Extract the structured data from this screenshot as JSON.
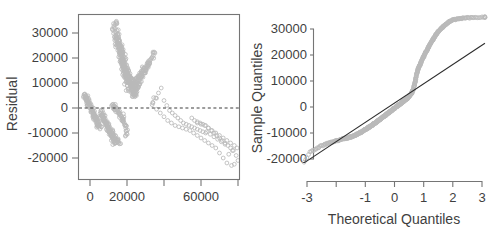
{
  "figure": {
    "panels": 2,
    "background": "#ffffff",
    "point_color": "#b9b9b9",
    "line_color": "#2b2b2b",
    "axis_color": "#757575",
    "text_color": "#3f3f3f"
  },
  "chart_data": [
    {
      "type": "scatter",
      "title": "",
      "xlabel": "",
      "ylabel": "Residual",
      "xlim": [
        -5000,
        82000
      ],
      "ylim": [
        -24000,
        35500
      ],
      "grid": false,
      "legend": null,
      "frame": "box",
      "xticks": [
        0,
        20000,
        40000,
        60000,
        80000
      ],
      "xticklabels": [
        "0",
        "20000",
        "",
        "60000",
        ""
      ],
      "yticks": [
        30000,
        20000,
        10000,
        0,
        -10000,
        -20000
      ],
      "yticklabels": [
        "30000",
        "20000",
        "10000",
        "0",
        "-10000",
        "-20000"
      ],
      "annotations": [
        {
          "kind": "hline",
          "y": 0,
          "style": "dashed",
          "label": "zero-residual-line"
        }
      ],
      "clusters": [
        {
          "name": "upper-plume",
          "x_range": [
            13000,
            34000
          ],
          "y_range": [
            4000,
            34500
          ],
          "n": 260
        },
        {
          "name": "lower-wedge",
          "x_range": [
            -2500,
            22000
          ],
          "y_range": [
            -14500,
            6000
          ],
          "n": 300
        },
        {
          "name": "right-tail",
          "x_range": [
            34000,
            80000
          ],
          "y_range": [
            -23000,
            14000
          ],
          "n": 150
        }
      ],
      "x": [
        -2800,
        -2300,
        -1900,
        -1500,
        -1100,
        -700,
        -300,
        100,
        400,
        800,
        1200,
        1600,
        2000,
        2400,
        2800,
        3200,
        3600,
        4000,
        4400,
        4800,
        -2500,
        -2000,
        -1600,
        -1200,
        -800,
        -400,
        0,
        400,
        900,
        1300,
        1700,
        2100,
        2500,
        2900,
        3300,
        3700,
        4100,
        4500,
        5000,
        5400,
        5800,
        6200,
        6600,
        7000,
        7400,
        7800,
        8200,
        8600,
        9000,
        9400,
        9800,
        10200,
        10600,
        11000,
        11400,
        11800,
        12200,
        12600,
        13000,
        13400,
        6000,
        6500,
        7000,
        7500,
        8000,
        8500,
        9000,
        9500,
        10000,
        10500,
        11000,
        11500,
        12000,
        12500,
        13000,
        13500,
        14000,
        14500,
        15000,
        15500,
        12500,
        12900,
        13300,
        13700,
        14100,
        14500,
        14900,
        15300,
        15700,
        16100,
        16500,
        16900,
        17300,
        17700,
        18100,
        18500,
        18900,
        19300,
        19700,
        20100,
        13000,
        13400,
        13800,
        14200,
        14600,
        15000,
        15400,
        15800,
        16200,
        16600,
        17000,
        17400,
        17800,
        18200,
        18600,
        19000,
        19400,
        19800,
        20200,
        20600,
        13500,
        14000,
        14500,
        15000,
        15500,
        16000,
        16500,
        17000,
        17500,
        18000,
        18500,
        19000,
        19500,
        20000,
        20500,
        21000,
        21500,
        22000,
        22500,
        23000,
        14000,
        14600,
        15200,
        15800,
        16400,
        17000,
        17600,
        18200,
        18800,
        19400,
        20000,
        20600,
        21200,
        21800,
        22400,
        23000,
        23600,
        24200,
        24800,
        25400,
        15000,
        15600,
        16200,
        16800,
        17400,
        18000,
        18600,
        19200,
        19800,
        20400,
        21000,
        21600,
        22200,
        22800,
        23400,
        24000,
        24600,
        25200,
        25800,
        26400,
        16000,
        16700,
        17400,
        18100,
        18800,
        19500,
        20200,
        20900,
        21600,
        22300,
        23000,
        23700,
        24400,
        25100,
        25800,
        26500,
        27200,
        27900,
        28600,
        29300,
        17000,
        17800,
        18600,
        19400,
        20200,
        21000,
        21800,
        22600,
        23400,
        24200,
        25000,
        25800,
        26600,
        27400,
        28200,
        29000,
        29800,
        30600,
        31400,
        32200,
        18000,
        18900,
        19800,
        20700,
        21600,
        22500,
        23400,
        24300,
        25200,
        26100,
        27000,
        27900,
        28800,
        29700,
        30600,
        31500,
        32400,
        33300,
        34200,
        35100,
        34000,
        35500,
        37000,
        38500,
        40000,
        41500,
        43000,
        44500,
        46000,
        47500,
        49000,
        50500,
        52000,
        53500,
        55000,
        56500,
        58000,
        59500,
        61000,
        62500,
        36000,
        38000,
        40000,
        42000,
        44000,
        46000,
        48000,
        50000,
        52000,
        54000,
        56000,
        58000,
        60000,
        62000,
        64000,
        66000,
        68000,
        70000,
        72000,
        74000,
        55000,
        56500,
        58000,
        59500,
        61000,
        62500,
        64000,
        65500,
        67000,
        68500,
        70000,
        71500,
        73000,
        74500,
        76000,
        77500,
        79000,
        80000,
        78000,
        76500,
        58000,
        60000,
        62000,
        64000,
        66000,
        68000,
        70000,
        72000,
        74000,
        76000,
        78000,
        79500,
        77000,
        75000,
        73000,
        71000,
        69000,
        67000,
        65000,
        63000
      ],
      "y": [
        5600,
        5000,
        4300,
        3600,
        2900,
        2200,
        1500,
        900,
        300,
        -300,
        -900,
        -1500,
        -2100,
        -2700,
        -3300,
        -3900,
        -4500,
        -5100,
        -5700,
        -6300,
        4800,
        4100,
        3400,
        2700,
        2000,
        1300,
        700,
        0,
        -700,
        -1400,
        -2100,
        -2800,
        -3500,
        -4200,
        -4900,
        -5600,
        -6300,
        -7000,
        -7700,
        -8400,
        -1200,
        -1900,
        -2600,
        -3300,
        -4000,
        -4700,
        -5400,
        -6100,
        -6800,
        -7500,
        -8200,
        -8900,
        -9600,
        -10300,
        -11000,
        -11700,
        -12400,
        -13100,
        -13500,
        -13900,
        -3000,
        -3600,
        -4200,
        -4800,
        -5400,
        -6000,
        -6600,
        -7200,
        -7800,
        -8400,
        -9000,
        -9600,
        -10200,
        -10800,
        -11400,
        -12000,
        -12600,
        -13200,
        -13600,
        -13900,
        1500,
        1000,
        500,
        200,
        -200,
        -600,
        -1000,
        -1400,
        -1800,
        -2300,
        -2800,
        -3300,
        -3900,
        -4500,
        -5200,
        -6000,
        -7000,
        -8000,
        -9200,
        -10500,
        32000,
        30500,
        29000,
        27500,
        26000,
        24500,
        27000,
        25500,
        24000,
        22500,
        21000,
        19500,
        18000,
        16500,
        15000,
        13500,
        12000,
        10500,
        9000,
        7500,
        33500,
        34200,
        31000,
        29500,
        28000,
        26500,
        25000,
        23500,
        22000,
        20500,
        19000,
        17500,
        16000,
        14500,
        13000,
        11500,
        10000,
        8500,
        7000,
        5500,
        29000,
        27500,
        26000,
        24500,
        23000,
        21500,
        20000,
        18500,
        17000,
        15500,
        14000,
        12500,
        11000,
        9500,
        8000,
        6500,
        5000,
        4500,
        5500,
        6500,
        26000,
        24500,
        23000,
        21500,
        20000,
        18500,
        17000,
        15500,
        14000,
        12500,
        11000,
        9500,
        8000,
        7000,
        6000,
        5500,
        6500,
        7500,
        8500,
        9500,
        22000,
        20500,
        19000,
        17500,
        16000,
        14500,
        13000,
        11500,
        10000,
        9000,
        8500,
        8000,
        9000,
        10000,
        11000,
        12000,
        13000,
        14000,
        15000,
        16000,
        18000,
        17000,
        16000,
        15000,
        14000,
        13000,
        12000,
        11000,
        10000,
        9500,
        9000,
        10000,
        11000,
        12000,
        13000,
        14000,
        15000,
        16000,
        17000,
        18000,
        14000,
        13000,
        12000,
        11000,
        10000,
        9500,
        9000,
        10000,
        11000,
        12000,
        13000,
        14000,
        15000,
        16000,
        17000,
        18000,
        19000,
        20000,
        21000,
        22000,
        2000,
        4000,
        6000,
        8000,
        3000,
        1000,
        -1000,
        -2000,
        -3000,
        -4000,
        -5000,
        -6000,
        -6500,
        -7000,
        -7500,
        -8000,
        -8500,
        -9000,
        -9500,
        -10000,
        -500,
        -2000,
        -3500,
        -5000,
        -6000,
        -7000,
        -7500,
        -8000,
        -8500,
        -9000,
        -10000,
        -11000,
        -12000,
        -13000,
        -14000,
        -15000,
        -16000,
        -18000,
        -20000,
        -22000,
        -4000,
        -5000,
        -5500,
        -6000,
        -6500,
        -7000,
        -8000,
        -9000,
        -10000,
        -11000,
        -12000,
        -13000,
        -14000,
        -15000,
        -16000,
        -17000,
        -19000,
        -21000,
        -22500,
        -23000,
        -6000,
        -6500,
        -7000,
        -8000,
        -9000,
        -10000,
        -11000,
        -12000,
        -13000,
        -14000,
        -15000,
        -16000,
        -17000,
        -18500,
        -14500,
        -13500,
        -12500,
        -11500,
        -10500,
        -9500
      ]
    },
    {
      "type": "scatter",
      "title": "",
      "xlabel": "Theoretical Quantiles",
      "ylabel": "Sample Quantiles",
      "xlim": [
        -3.3,
        3.3
      ],
      "ylim": [
        -23500,
        35500
      ],
      "grid": false,
      "legend": null,
      "frame": "L-shaped",
      "xticks": [
        -3,
        -2,
        -1,
        0,
        1,
        2,
        3
      ],
      "xticklabels": [
        "-3",
        "",
        "-1",
        "0",
        "1",
        "2",
        "3"
      ],
      "yticks": [
        30000,
        20000,
        10000,
        0,
        -10000,
        -20000
      ],
      "yticklabels": [
        "30000",
        "20000",
        "10000",
        "0",
        "-10000",
        "-20000"
      ],
      "annotations": [
        {
          "kind": "qq-reference-line",
          "p1": [
            -3.1,
            -21500
          ],
          "p2": [
            3.1,
            24500
          ],
          "label": "qq-reference-line"
        }
      ],
      "theoretical": [
        -3.1,
        -2.9,
        -2.72,
        -2.58,
        -2.46,
        -2.36,
        -2.27,
        -2.19,
        -2.12,
        -2.05,
        -1.99,
        -1.93,
        -1.88,
        -1.83,
        -1.78,
        -1.74,
        -1.7,
        -1.66,
        -1.62,
        -1.58,
        -1.55,
        -1.51,
        -1.48,
        -1.45,
        -1.42,
        -1.39,
        -1.36,
        -1.33,
        -1.31,
        -1.28,
        -1.25,
        -1.23,
        -1.2,
        -1.18,
        -1.15,
        -1.13,
        -1.11,
        -1.08,
        -1.06,
        -1.04,
        -1.02,
        -1.0,
        -0.97,
        -0.95,
        -0.93,
        -0.91,
        -0.89,
        -0.87,
        -0.85,
        -0.83,
        -0.81,
        -0.79,
        -0.77,
        -0.75,
        -0.73,
        -0.72,
        -0.7,
        -0.68,
        -0.66,
        -0.64,
        -0.62,
        -0.6,
        -0.59,
        -0.57,
        -0.55,
        -0.53,
        -0.51,
        -0.5,
        -0.48,
        -0.46,
        -0.44,
        -0.43,
        -0.41,
        -0.39,
        -0.37,
        -0.36,
        -0.34,
        -0.32,
        -0.3,
        -0.29,
        -0.27,
        -0.25,
        -0.23,
        -0.22,
        -0.2,
        -0.18,
        -0.17,
        -0.15,
        -0.13,
        -0.11,
        -0.1,
        -0.08,
        -0.06,
        -0.05,
        -0.03,
        -0.01,
        0.01,
        0.03,
        0.05,
        0.06,
        0.08,
        0.1,
        0.11,
        0.13,
        0.15,
        0.17,
        0.18,
        0.2,
        0.22,
        0.23,
        0.25,
        0.27,
        0.29,
        0.3,
        0.32,
        0.34,
        0.36,
        0.37,
        0.39,
        0.41,
        0.43,
        0.44,
        0.46,
        0.48,
        0.5,
        0.51,
        0.53,
        0.55,
        0.57,
        0.59,
        0.6,
        0.62,
        0.64,
        0.66,
        0.68,
        0.7,
        0.72,
        0.73,
        0.75,
        0.77,
        0.79,
        0.81,
        0.83,
        0.85,
        0.87,
        0.89,
        0.91,
        0.93,
        0.95,
        0.97,
        1.0,
        1.02,
        1.04,
        1.06,
        1.08,
        1.11,
        1.13,
        1.15,
        1.18,
        1.2,
        1.23,
        1.25,
        1.28,
        1.31,
        1.33,
        1.36,
        1.39,
        1.42,
        1.45,
        1.48,
        1.51,
        1.55,
        1.58,
        1.62,
        1.66,
        1.7,
        1.74,
        1.78,
        1.83,
        1.88,
        1.93,
        1.99,
        2.05,
        2.12,
        2.19,
        2.27,
        2.36,
        2.46,
        2.58,
        2.72,
        2.9,
        3.1
      ],
      "sample": [
        -21500,
        -17500,
        -16200,
        -15400,
        -14800,
        -14300,
        -13900,
        -13600,
        -13400,
        -13200,
        -13000,
        -12800,
        -12600,
        -12400,
        -12300,
        -12200,
        -12100,
        -12000,
        -11900,
        -11800,
        -11700,
        -11600,
        -11500,
        -11350,
        -11200,
        -11050,
        -10900,
        -10750,
        -10600,
        -10450,
        -10300,
        -10150,
        -10000,
        -9850,
        -9700,
        -9550,
        -9400,
        -9250,
        -9100,
        -8950,
        -8800,
        -8650,
        -8500,
        -8350,
        -8200,
        -8050,
        -7900,
        -7750,
        -7600,
        -7450,
        -7300,
        -7150,
        -7000,
        -6850,
        -6700,
        -6550,
        -6400,
        -6250,
        -6100,
        -5950,
        -5800,
        -5650,
        -5500,
        -5350,
        -5200,
        -5050,
        -4900,
        -4750,
        -4600,
        -4450,
        -4300,
        -4150,
        -4000,
        -3850,
        -3700,
        -3550,
        -3400,
        -3250,
        -3100,
        -2950,
        -2800,
        -2650,
        -2500,
        -2350,
        -2200,
        -2050,
        -1900,
        -1750,
        -1600,
        -1450,
        -1300,
        -1150,
        -1000,
        -850,
        -700,
        -550,
        -400,
        -250,
        -100,
        50,
        200,
        350,
        500,
        650,
        800,
        950,
        1100,
        1250,
        1400,
        1550,
        1700,
        1850,
        2000,
        2150,
        2300,
        2450,
        2600,
        2750,
        2900,
        3050,
        3200,
        3400,
        3600,
        3800,
        4000,
        4200,
        4450,
        4700,
        5000,
        5300,
        5700,
        6200,
        6800,
        7500,
        8300,
        9200,
        10200,
        11200,
        12200,
        13100,
        13900,
        14600,
        15200,
        15700,
        16200,
        16700,
        17200,
        17700,
        18200,
        18700,
        19300,
        19800,
        20300,
        20800,
        21300,
        21800,
        22300,
        22800,
        23300,
        23800,
        24300,
        24800,
        25300,
        25800,
        26300,
        26800,
        27300,
        27800,
        28300,
        28800,
        29200,
        29600,
        30000,
        30400,
        30800,
        31200,
        31600,
        32000,
        32400,
        32800,
        33100,
        33400,
        33600,
        33800,
        33900,
        34000,
        34100,
        34200,
        34300,
        34400,
        34500,
        34600
      ]
    }
  ]
}
